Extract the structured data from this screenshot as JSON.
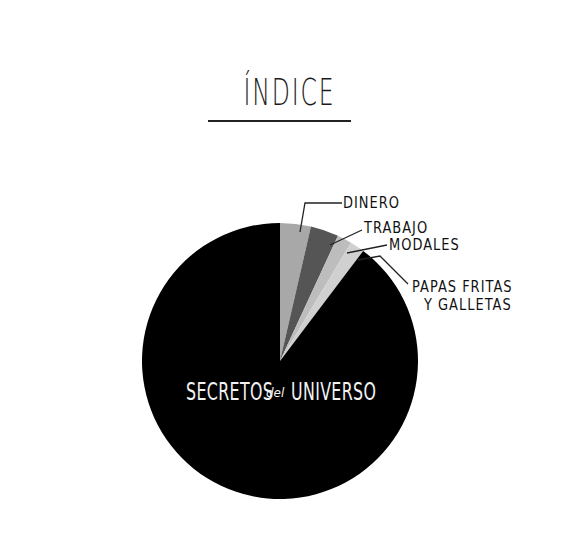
{
  "chart_data": {
    "type": "pie",
    "title": "ÍNDICE",
    "start_angle_deg": 0,
    "direction": "clockwise",
    "slices": [
      {
        "label": "DINERO",
        "value": 3.6,
        "color": "#a8a8a8"
      },
      {
        "label": "TRABAJO",
        "value": 3.3,
        "color": "#555555"
      },
      {
        "label": "MODALES",
        "value": 1.7,
        "color": "#bdbdbd"
      },
      {
        "label": "PAPAS FRITAS Y GALLETAS",
        "value": 1.7,
        "color": "#d0d0d0"
      },
      {
        "label": "SECRETOS del UNIVERSO",
        "value": 89.7,
        "color": "#000000"
      }
    ],
    "legend": "callout labels",
    "grid": false
  },
  "labels": {
    "title": "ÍNDICE",
    "dinero": "DINERO",
    "trabajo": "TRABAJO",
    "modales": "MODALES",
    "papas_line1": "PAPAS FRITAS",
    "papas_line2": "Y GALLETAS",
    "secretos": "SECRETOS",
    "del": "del",
    "universo": "UNIVERSO"
  }
}
